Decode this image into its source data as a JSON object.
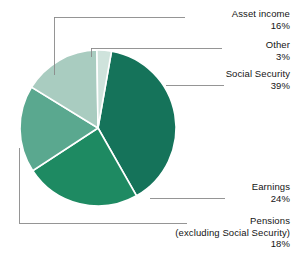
{
  "chart_data": {
    "type": "pie",
    "title": "",
    "subtitle": "",
    "xlabel": "",
    "ylabel": "",
    "legend_position": "callout-labels",
    "grid": false,
    "units": "percent",
    "total": 100,
    "categories": [
      "Social Security",
      "Earnings",
      "Pensions (excluding Social Security)",
      "Asset income",
      "Other"
    ],
    "values": [
      39,
      24,
      18,
      16,
      3
    ],
    "slices": [
      {
        "id": "social-security",
        "label": "Social Security",
        "sublabel": "",
        "value": 39,
        "value_text": "39%",
        "color": "#15735a",
        "start_angle_deg": 10,
        "end_angle_deg": 150.4
      },
      {
        "id": "earnings",
        "label": "Earnings",
        "sublabel": "",
        "value": 24,
        "value_text": "24%",
        "color": "#1e8a62",
        "start_angle_deg": 150.4,
        "end_angle_deg": 236.8
      },
      {
        "id": "pensions",
        "label": "Pensions",
        "sublabel": "(excluding Social Security)",
        "value": 18,
        "value_text": "18%",
        "color": "#5aa88f",
        "start_angle_deg": 236.8,
        "end_angle_deg": 301.6
      },
      {
        "id": "asset-income",
        "label": "Asset income",
        "sublabel": "",
        "value": 16,
        "value_text": "16%",
        "color": "#a9ccc0",
        "start_angle_deg": 301.6,
        "end_angle_deg": 359.2
      },
      {
        "id": "other",
        "label": "Other",
        "sublabel": "",
        "value": 3,
        "value_text": "3%",
        "color": "#cfe3dc",
        "start_angle_deg": 359.2,
        "end_angle_deg": 10
      }
    ],
    "colors": {
      "social_security": "#15735a",
      "earnings": "#1e8a62",
      "pensions": "#5aa88f",
      "asset_income": "#a9ccc0",
      "other": "#cfe3dc",
      "leader_line": "#8a8a8a",
      "slice_border": "#ffffff",
      "text": "#141414",
      "background": "#ffffff"
    }
  }
}
